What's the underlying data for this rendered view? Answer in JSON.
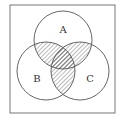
{
  "diagram": {
    "type": "venn",
    "frame": {
      "x": 10,
      "y": 5,
      "width": 105,
      "height": 108
    },
    "circles": [
      {
        "id": "A",
        "label": "A",
        "cx": 63,
        "cy": 40,
        "r": 29,
        "label_x": 63,
        "label_y": 33
      },
      {
        "id": "B",
        "label": "B",
        "cx": 46,
        "cy": 71,
        "r": 29,
        "label_x": 37,
        "label_y": 82
      },
      {
        "id": "C",
        "label": "C",
        "cx": 80,
        "cy": 71,
        "r": 29,
        "label_x": 90,
        "label_y": 82
      }
    ],
    "shaded_regions": [
      "A∩B",
      "A∩C",
      "B∩C"
    ],
    "colors": {
      "stroke": "#555555",
      "hatch": "#666666",
      "background": "#ffffff"
    }
  }
}
